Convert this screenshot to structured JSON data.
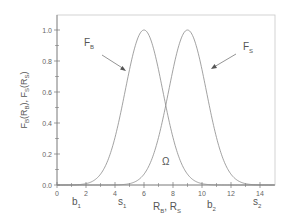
{
  "chart_data": {
    "type": "line",
    "title": "",
    "xlabel": "R_B, R_S",
    "ylabel": "F_B(R_B), F_S(R_S)",
    "xlim": [
      0,
      15
    ],
    "ylim": [
      0,
      1.1
    ],
    "x_ticks": [
      0,
      2,
      4,
      6,
      8,
      10,
      12,
      14
    ],
    "y_ticks": [
      0.0,
      0.2,
      0.4,
      0.6,
      0.8,
      1.0
    ],
    "y_tick_labels": [
      "0.0",
      "0.2",
      "0.4",
      "0.6",
      "0.8",
      "1.0"
    ],
    "x_tick_labels": [
      "0",
      "2",
      "4",
      "6",
      "8",
      "10",
      "12",
      "14"
    ],
    "grid": false,
    "series": [
      {
        "name": "F_B",
        "shape": "gaussian",
        "center": 6,
        "sigma": 1.3,
        "peak": 1.0
      },
      {
        "name": "F_S",
        "shape": "gaussian",
        "center": 9,
        "sigma": 1.3,
        "peak": 1.0
      }
    ],
    "annotations": [
      {
        "text": "F",
        "sub": "B",
        "x": 2.5,
        "y": 0.85,
        "arrow_to": [
          4.8,
          0.62
        ]
      },
      {
        "text": "F",
        "sub": "S",
        "x": 13.0,
        "y": 0.85,
        "arrow_to": [
          10.0,
          0.6
        ]
      },
      {
        "text": "Ω",
        "x": 7.4,
        "y": 0.16
      },
      {
        "text": "b",
        "sub": "1",
        "x": 1.3,
        "y": -0.08
      },
      {
        "text": "s",
        "sub": "1",
        "x": 4.5,
        "y": -0.08
      },
      {
        "text": "b",
        "sub": "2",
        "x": 10.4,
        "y": -0.08
      },
      {
        "text": "s",
        "sub": "2",
        "x": 13.5,
        "y": -0.08
      }
    ]
  },
  "labels": {
    "fb": "F",
    "fb_sub": "B",
    "fs": "F",
    "fs_sub": "S",
    "omega": "Ω",
    "b1": "b",
    "b1_sub": "1",
    "s1": "s",
    "s1_sub": "1",
    "b2": "b",
    "b2_sub": "2",
    "s2": "s",
    "s2_sub": "2",
    "xlabel_rb": "R",
    "xlabel_rb_sub": "B",
    "xlabel_sep": ", ",
    "xlabel_rs": "R",
    "xlabel_rs_sub": "S",
    "ylabel": "F_B(R_B), F_S(R_S)"
  },
  "colors": {
    "curve": "#8a8a8a",
    "axis": "#777777",
    "frame": "#bbbbbb",
    "text": "#555555"
  }
}
